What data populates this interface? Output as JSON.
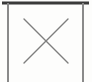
{
  "figure": {
    "name": "crossed-box-symbol",
    "caption": "",
    "background_color": "#fdfdfc",
    "canvas": {
      "width": 92,
      "height": 82
    },
    "elements": {
      "top_rule": {
        "label": "top-rule",
        "color": "#3a3a3a",
        "x1": 2,
        "y1": 3,
        "x2": 89,
        "y2": 3,
        "thickness": 3
      },
      "left_post": {
        "label": "left-vertical-line",
        "color": "#8a8a8a",
        "x1": 8,
        "y1": 3,
        "x2": 8,
        "y2": 82,
        "thickness": 2
      },
      "right_post": {
        "label": "right-vertical-line",
        "color": "#8a8a8a",
        "x1": 83,
        "y1": 3,
        "x2": 83,
        "y2": 82,
        "thickness": 2
      },
      "diagonal_down": {
        "label": "diagonal-top-left-to-bottom-right",
        "color": "#7e7e7e",
        "x1": 24,
        "y1": 19,
        "x2": 68,
        "y2": 63,
        "thickness": 1.4
      },
      "diagonal_up": {
        "label": "diagonal-bottom-left-to-top-right",
        "color": "#7e7e7e",
        "x1": 24,
        "y1": 63,
        "x2": 68,
        "y2": 19,
        "thickness": 1.4
      },
      "cross_center": {
        "label": "cross-intersection",
        "x": 46,
        "y": 41
      }
    }
  }
}
